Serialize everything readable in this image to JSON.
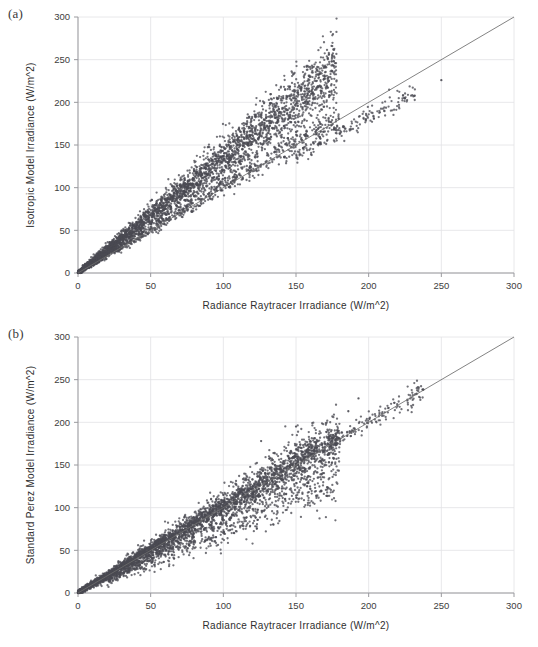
{
  "figure": {
    "panels": [
      {
        "tag": "(a)",
        "chart_key": 0
      },
      {
        "tag": "(b)",
        "chart_key": 1
      }
    ]
  },
  "chart_data": [
    {
      "type": "scatter",
      "title": "",
      "panel_label": "(a)",
      "xlabel": "Radiance Raytracer Irradiance (W/m^2)",
      "ylabel": "Isotropic Model Irradiance (W/m^2)",
      "xlim": [
        0,
        300
      ],
      "ylim": [
        0,
        300
      ],
      "xticks": [
        0,
        50,
        100,
        150,
        200,
        250,
        300
      ],
      "yticks": [
        0,
        50,
        100,
        150,
        200,
        250,
        300
      ],
      "xtick_labels": [
        "0",
        "50",
        "100",
        "150",
        "200",
        "250",
        "300"
      ],
      "ytick_labels": [
        "0",
        "50",
        "100",
        "150",
        "200",
        "250",
        "300"
      ],
      "grid": true,
      "legend": "none",
      "marker_color": "#4a4a52",
      "marker_size": 1.15,
      "reference_line": {
        "name": "1:1 identity line",
        "from": [
          0,
          0
        ],
        "to": [
          300,
          300
        ],
        "color": "#6d6d6d"
      },
      "point_count": 4200,
      "description": "Dense cone of points fanning upward from the origin, lying mostly above the 1:1 line; main branch slope about 1.38 reaching roughly (175, 235), a secondary lower branch near slope 0.95 extending to about (230, 210), plus one isolated point near (250, 225).",
      "branches": [
        {
          "name": "main-overprediction-branch",
          "weight": 0.78,
          "x_range": [
            0,
            178
          ],
          "slope": 1.34,
          "intercept": 0.0,
          "spread_base": 1.2,
          "spread_growth": 0.115,
          "x_bias": 1.45
        },
        {
          "name": "lower-diagonal-branch",
          "weight": 0.18,
          "x_range": [
            0,
            180
          ],
          "slope": 1.02,
          "intercept": 0.0,
          "spread_base": 0.8,
          "spread_growth": 0.045,
          "x_bias": 1.2
        },
        {
          "name": "sparse-high-tail",
          "weight": 0.04,
          "x_range": [
            150,
            232
          ],
          "slope": 0.91,
          "intercept": 0.0,
          "spread_base": 1.5,
          "spread_growth": 0.02,
          "x_bias": 1.0
        }
      ],
      "outliers": [
        [
          250,
          226
        ]
      ]
    },
    {
      "type": "scatter",
      "title": "",
      "panel_label": "(b)",
      "xlabel": "Radiance Raytracer Irradiance (W/m^2)",
      "ylabel": "Standard Perez Model Irradiance (W/m^2)",
      "xlim": [
        0,
        300
      ],
      "ylim": [
        0,
        300
      ],
      "xticks": [
        0,
        50,
        100,
        150,
        200,
        250,
        300
      ],
      "yticks": [
        0,
        50,
        100,
        150,
        200,
        250,
        300
      ],
      "xtick_labels": [
        "0",
        "50",
        "100",
        "150",
        "200",
        "250",
        "300"
      ],
      "ytick_labels": [
        "0",
        "50",
        "100",
        "150",
        "200",
        "250",
        "300"
      ],
      "grid": true,
      "legend": "none",
      "marker_color": "#4a4a52",
      "marker_size": 1.15,
      "reference_line": {
        "name": "1:1 identity line",
        "from": [
          0,
          0
        ],
        "to": [
          300,
          300
        ],
        "color": "#6d6d6d"
      },
      "point_count": 4200,
      "description": "Broad scatter cloud centred on the 1:1 line, widening with magnitude; bulk of points between x = 0 and 180 with y scatter of plus/minus 35 W/m^2, a tight upper edge hugging the identity line, a diffuse low-lying lobe below it, and a sparse tail following the identity line out to about 235 W/m^2.",
      "branches": [
        {
          "name": "central-cloud",
          "weight": 0.62,
          "x_range": [
            0,
            180
          ],
          "slope": 1.0,
          "intercept": 0.0,
          "spread_base": 1.0,
          "spread_growth": 0.095,
          "x_bias": 1.35
        },
        {
          "name": "upper-edge-band",
          "weight": 0.2,
          "x_range": [
            0,
            180
          ],
          "slope": 1.02,
          "intercept": 1.5,
          "spread_base": 0.7,
          "spread_growth": 0.03,
          "x_bias": 1.3
        },
        {
          "name": "lower-lobe",
          "weight": 0.14,
          "x_range": [
            20,
            180
          ],
          "slope": 0.74,
          "intercept": 0.0,
          "spread_base": 1.8,
          "spread_growth": 0.075,
          "x_bias": 1.15
        },
        {
          "name": "sparse-identity-tail",
          "weight": 0.04,
          "x_range": [
            160,
            238
          ],
          "slope": 1.0,
          "intercept": 0.0,
          "spread_base": 1.5,
          "spread_growth": 0.022,
          "x_bias": 1.0
        }
      ],
      "outliers": [
        [
          193,
          228
        ],
        [
          186,
          213
        ],
        [
          150,
          195
        ],
        [
          126,
          178
        ]
      ]
    }
  ]
}
